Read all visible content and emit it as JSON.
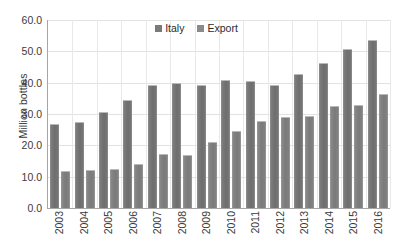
{
  "chart_data": {
    "type": "bar",
    "title": "",
    "xlabel": "",
    "ylabel": "Million bottles",
    "categories": [
      "2003",
      "2004",
      "2005",
      "2006",
      "2007",
      "2008",
      "2009",
      "2010",
      "2011",
      "2012",
      "2013",
      "2014",
      "2015",
      "2016"
    ],
    "series": [
      {
        "name": "Italy",
        "color": "#7a7a7a",
        "values": [
          26.8,
          27.3,
          30.8,
          34.6,
          39.3,
          40.0,
          39.3,
          40.7,
          40.5,
          39.3,
          42.9,
          46.3,
          50.7,
          53.7
        ]
      },
      {
        "name": "Export",
        "color": "#8a8a8a",
        "values": [
          11.9,
          12.1,
          12.5,
          13.9,
          17.3,
          16.9,
          21.2,
          24.5,
          27.8,
          29.2,
          29.4,
          32.6,
          32.9,
          36.3
        ]
      }
    ],
    "ylim": [
      0.0,
      60.0
    ],
    "ytick_step": 10.0,
    "ytick_labels": [
      "0.0",
      "10.0",
      "20.0",
      "30.0",
      "40.0",
      "50.0",
      "60.0"
    ],
    "grid": "horizontal-and-vertical",
    "legend_position": "top-center"
  }
}
